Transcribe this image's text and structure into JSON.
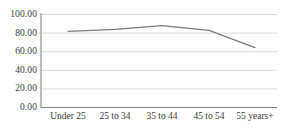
{
  "chart_data": {
    "type": "line",
    "title": "",
    "subtitle": "",
    "xlabel": "",
    "ylabel": "",
    "categories": [
      "Under 25",
      "25 to 34",
      "35 to 44",
      "45 to 54",
      "55 years+"
    ],
    "values": [
      82.0,
      84.0,
      88.0,
      83.0,
      64.5
    ],
    "series": [
      {
        "name": "",
        "values": [
          82.0,
          84.0,
          88.0,
          83.0,
          64.5
        ]
      }
    ],
    "ylim": [
      0,
      100
    ],
    "yticks": [
      0,
      20,
      40,
      60,
      80,
      100
    ],
    "ytick_labels": [
      "0.00",
      "20.00",
      "40.00",
      "60.00",
      "80.00",
      "100.00"
    ],
    "xtick_labels": [
      "Under 25",
      "25 to 34",
      "35 to 44",
      "45 to 54",
      "55 years+"
    ],
    "grid": true,
    "grid_axis": "y",
    "legend": false,
    "legend_position": "none",
    "annotations": []
  },
  "colors": {
    "line": "#7a7a7a",
    "grid": "#d9d9d9",
    "axis": "#808080",
    "text": "#3a3a3a",
    "background": "#ffffff"
  },
  "axes": {
    "y": {
      "ticks": [
        {
          "label": "100.00",
          "value": 100
        },
        {
          "label": "80.00",
          "value": 80
        },
        {
          "label": "60.00",
          "value": 60
        },
        {
          "label": "40.00",
          "value": 40
        },
        {
          "label": "20.00",
          "value": 20
        },
        {
          "label": "0.00",
          "value": 0
        }
      ]
    },
    "x": {
      "ticks": [
        {
          "label": "Under 25"
        },
        {
          "label": "25 to 34"
        },
        {
          "label": "35 to 44"
        },
        {
          "label": "45 to 54"
        },
        {
          "label": "55 years+"
        }
      ]
    }
  }
}
